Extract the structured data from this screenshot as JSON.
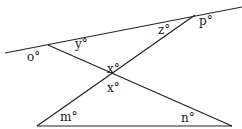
{
  "diagram": {
    "type": "geometry-angles",
    "lines": [
      {
        "name": "top-transversal",
        "x1": 5,
        "y1": 53,
        "x2": 242,
        "y2": 7
      },
      {
        "name": "left-diagonal",
        "x1": 48,
        "y1": 45,
        "x2": 232,
        "y2": 126
      },
      {
        "name": "right-diagonal",
        "x1": 195,
        "y1": 15,
        "x2": 37,
        "y2": 126
      },
      {
        "name": "bottom-base",
        "x1": 37,
        "y1": 126,
        "x2": 232,
        "y2": 126
      }
    ],
    "labels": {
      "o": {
        "text": "o°",
        "x": 27,
        "y": 61
      },
      "y": {
        "text": "y°",
        "x": 75,
        "y": 48
      },
      "z": {
        "text": "z°",
        "x": 158,
        "y": 34
      },
      "p": {
        "text": "p°",
        "x": 199,
        "y": 25
      },
      "x_top": {
        "text": "x°",
        "x": 107,
        "y": 73
      },
      "x_bottom": {
        "text": "x°",
        "x": 107,
        "y": 92
      },
      "m": {
        "text": "m°",
        "x": 60,
        "y": 121
      },
      "n": {
        "text": "n°",
        "x": 181,
        "y": 122
      }
    }
  }
}
